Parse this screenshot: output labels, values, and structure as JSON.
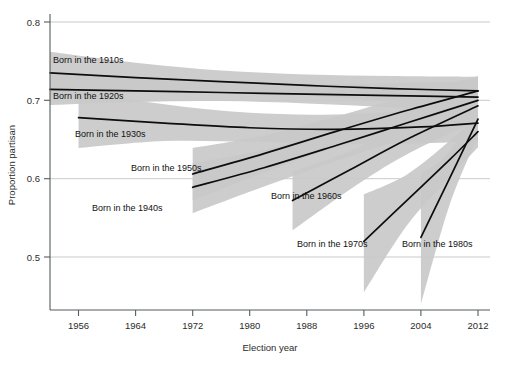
{
  "chart_data": {
    "type": "line",
    "title": "",
    "xlabel": "Election year",
    "ylabel": "Proportion partisan",
    "xlim": [
      1952,
      2012
    ],
    "ylim": [
      0.44,
      0.8
    ],
    "xticks": [
      1956,
      1964,
      1972,
      1980,
      1988,
      1996,
      2004,
      2012
    ],
    "xticklabels": [
      "1956",
      "1964",
      "1972",
      "1980",
      "1988",
      "1996",
      "2004",
      "2012"
    ],
    "yticks": [
      0.5,
      0.6,
      0.7,
      0.8
    ],
    "yticklabels": [
      "0.5",
      "0.6",
      "0.7",
      "0.8"
    ],
    "grid": "horizontal",
    "legend": "inline-annotations",
    "band_color": "#c9c9c9",
    "line_color": "#0d0d0d",
    "band_description": "shaded grey 95% confidence interval around each cohort trend",
    "series": [
      {
        "name": "Born in the 1910s",
        "label": "Born in the 1910s",
        "x": [
          1952,
          1964,
          1976,
          1988,
          2000,
          2012
        ],
        "values": [
          0.735,
          0.729,
          0.724,
          0.719,
          0.715,
          0.712
        ],
        "band_lower": [
          0.706,
          0.712,
          0.712,
          0.706,
          0.699,
          0.694
        ],
        "band_upper": [
          0.762,
          0.748,
          0.738,
          0.733,
          0.731,
          0.73
        ]
      },
      {
        "name": "Born in the 1920s",
        "label": "Born in the 1920s",
        "x": [
          1952,
          1964,
          1976,
          1988,
          2000,
          2012
        ],
        "values": [
          0.714,
          0.712,
          0.71,
          0.708,
          0.706,
          0.704
        ],
        "band_lower": [
          0.694,
          0.698,
          0.699,
          0.696,
          0.691,
          0.686
        ],
        "band_upper": [
          0.734,
          0.727,
          0.722,
          0.72,
          0.722,
          0.724
        ]
      },
      {
        "name": "Born in the 1930s",
        "label": "Born in the 1930s",
        "x": [
          1956,
          1968,
          1980,
          1992,
          2004,
          2012
        ],
        "values": [
          0.678,
          0.671,
          0.665,
          0.663,
          0.666,
          0.671
        ],
        "band_lower": [
          0.639,
          0.648,
          0.647,
          0.644,
          0.645,
          0.648
        ],
        "band_upper": [
          0.712,
          0.695,
          0.684,
          0.682,
          0.688,
          0.696
        ]
      },
      {
        "name": "Born in the 1940s",
        "label": "Born in the 1940s",
        "x": [
          1972,
          1982,
          1992,
          2002,
          2012
        ],
        "values": [
          0.589,
          0.614,
          0.642,
          0.671,
          0.7
        ],
        "band_lower": [
          0.556,
          0.59,
          0.622,
          0.652,
          0.68
        ],
        "band_upper": [
          0.62,
          0.637,
          0.661,
          0.69,
          0.72
        ]
      },
      {
        "name": "Born in the 1950s",
        "label": "Born in the 1950s",
        "x": [
          1972,
          1982,
          1992,
          2002,
          2012
        ],
        "values": [
          0.606,
          0.632,
          0.66,
          0.687,
          0.712
        ],
        "band_lower": [
          0.572,
          0.608,
          0.64,
          0.667,
          0.692
        ],
        "band_upper": [
          0.639,
          0.655,
          0.679,
          0.706,
          0.731
        ]
      },
      {
        "name": "Born in the 1960s",
        "label": "Born in the 1960s",
        "x": [
          1986,
          1994,
          2002,
          2012
        ],
        "values": [
          0.572,
          0.611,
          0.65,
          0.693
        ],
        "band_lower": [
          0.534,
          0.586,
          0.631,
          0.674
        ],
        "band_upper": [
          0.609,
          0.635,
          0.669,
          0.712
        ]
      },
      {
        "name": "Born in the 1970s",
        "label": "Born in the 1970s",
        "x": [
          1996,
          2002,
          2008,
          2012
        ],
        "values": [
          0.52,
          0.572,
          0.624,
          0.66
        ],
        "band_lower": [
          0.455,
          0.54,
          0.601,
          0.64
        ],
        "band_upper": [
          0.58,
          0.605,
          0.648,
          0.681
        ]
      },
      {
        "name": "Born in the 1980s",
        "label": "Born in the 1980s",
        "x": [
          2004,
          2008,
          2012
        ],
        "values": [
          0.525,
          0.6,
          0.676
        ],
        "band_lower": [
          0.44,
          0.566,
          0.654
        ],
        "band_upper": [
          0.606,
          0.634,
          0.698
        ]
      }
    ]
  },
  "annotations": {
    "labels": [
      {
        "text": "Born in the 1910s",
        "x": 53,
        "y": 63
      },
      {
        "text": "Born in the 1920s",
        "x": 53,
        "y": 99
      },
      {
        "text": "Born in the 1930s",
        "x": 75,
        "y": 137
      },
      {
        "text": "Born in the 1950s",
        "x": 131,
        "y": 171
      },
      {
        "text": "Born in the 1940s",
        "x": 92,
        "y": 211
      },
      {
        "text": "Born in the 1960s",
        "x": 271,
        "y": 199
      },
      {
        "text": "Born in the 1970s",
        "x": 297,
        "y": 247
      },
      {
        "text": "Born in the 1980s",
        "x": 402,
        "y": 247
      }
    ]
  },
  "axes": {
    "x_label": "Election year",
    "y_label": "Proportion partisan",
    "x_tick_labels": [
      "1956",
      "1964",
      "1972",
      "1980",
      "1988",
      "1996",
      "2004",
      "2012"
    ],
    "y_tick_labels": [
      "0.5",
      "0.6",
      "0.7",
      "0.8"
    ]
  }
}
